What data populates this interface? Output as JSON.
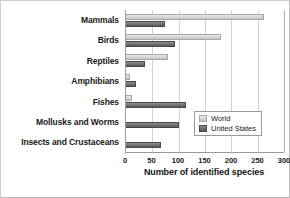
{
  "chart_data": {
    "type": "bar",
    "orientation": "horizontal",
    "title": "",
    "xlabel": "Number of identified species",
    "ylabel": "",
    "xlim": [
      0,
      300
    ],
    "xticks": [
      0,
      50,
      100,
      150,
      200,
      250,
      300
    ],
    "grid": true,
    "legend_position": "lower-right-inside",
    "categories": [
      "Mammals",
      "Birds",
      "Reptiles",
      "Amphibians",
      "Fishes",
      "Mollusks and Worms",
      "Insects and Crustaceans"
    ],
    "series": [
      {
        "name": "World",
        "color": "#d4d4d4",
        "values": [
          262,
          180,
          80,
          8,
          11,
          1,
          1
        ]
      },
      {
        "name": "United States",
        "color": "#6a6a6a",
        "values": [
          74,
          93,
          36,
          19,
          113,
          100,
          66
        ]
      }
    ]
  },
  "legend": {
    "entries": [
      {
        "label": "World"
      },
      {
        "label": "United States"
      }
    ]
  },
  "colors": {
    "world": "#d4d4d4",
    "united_states": "#6a6a6a",
    "grid": "#d2d2d2",
    "axis": "#9a9a9a",
    "text": "#1a1a1a"
  }
}
